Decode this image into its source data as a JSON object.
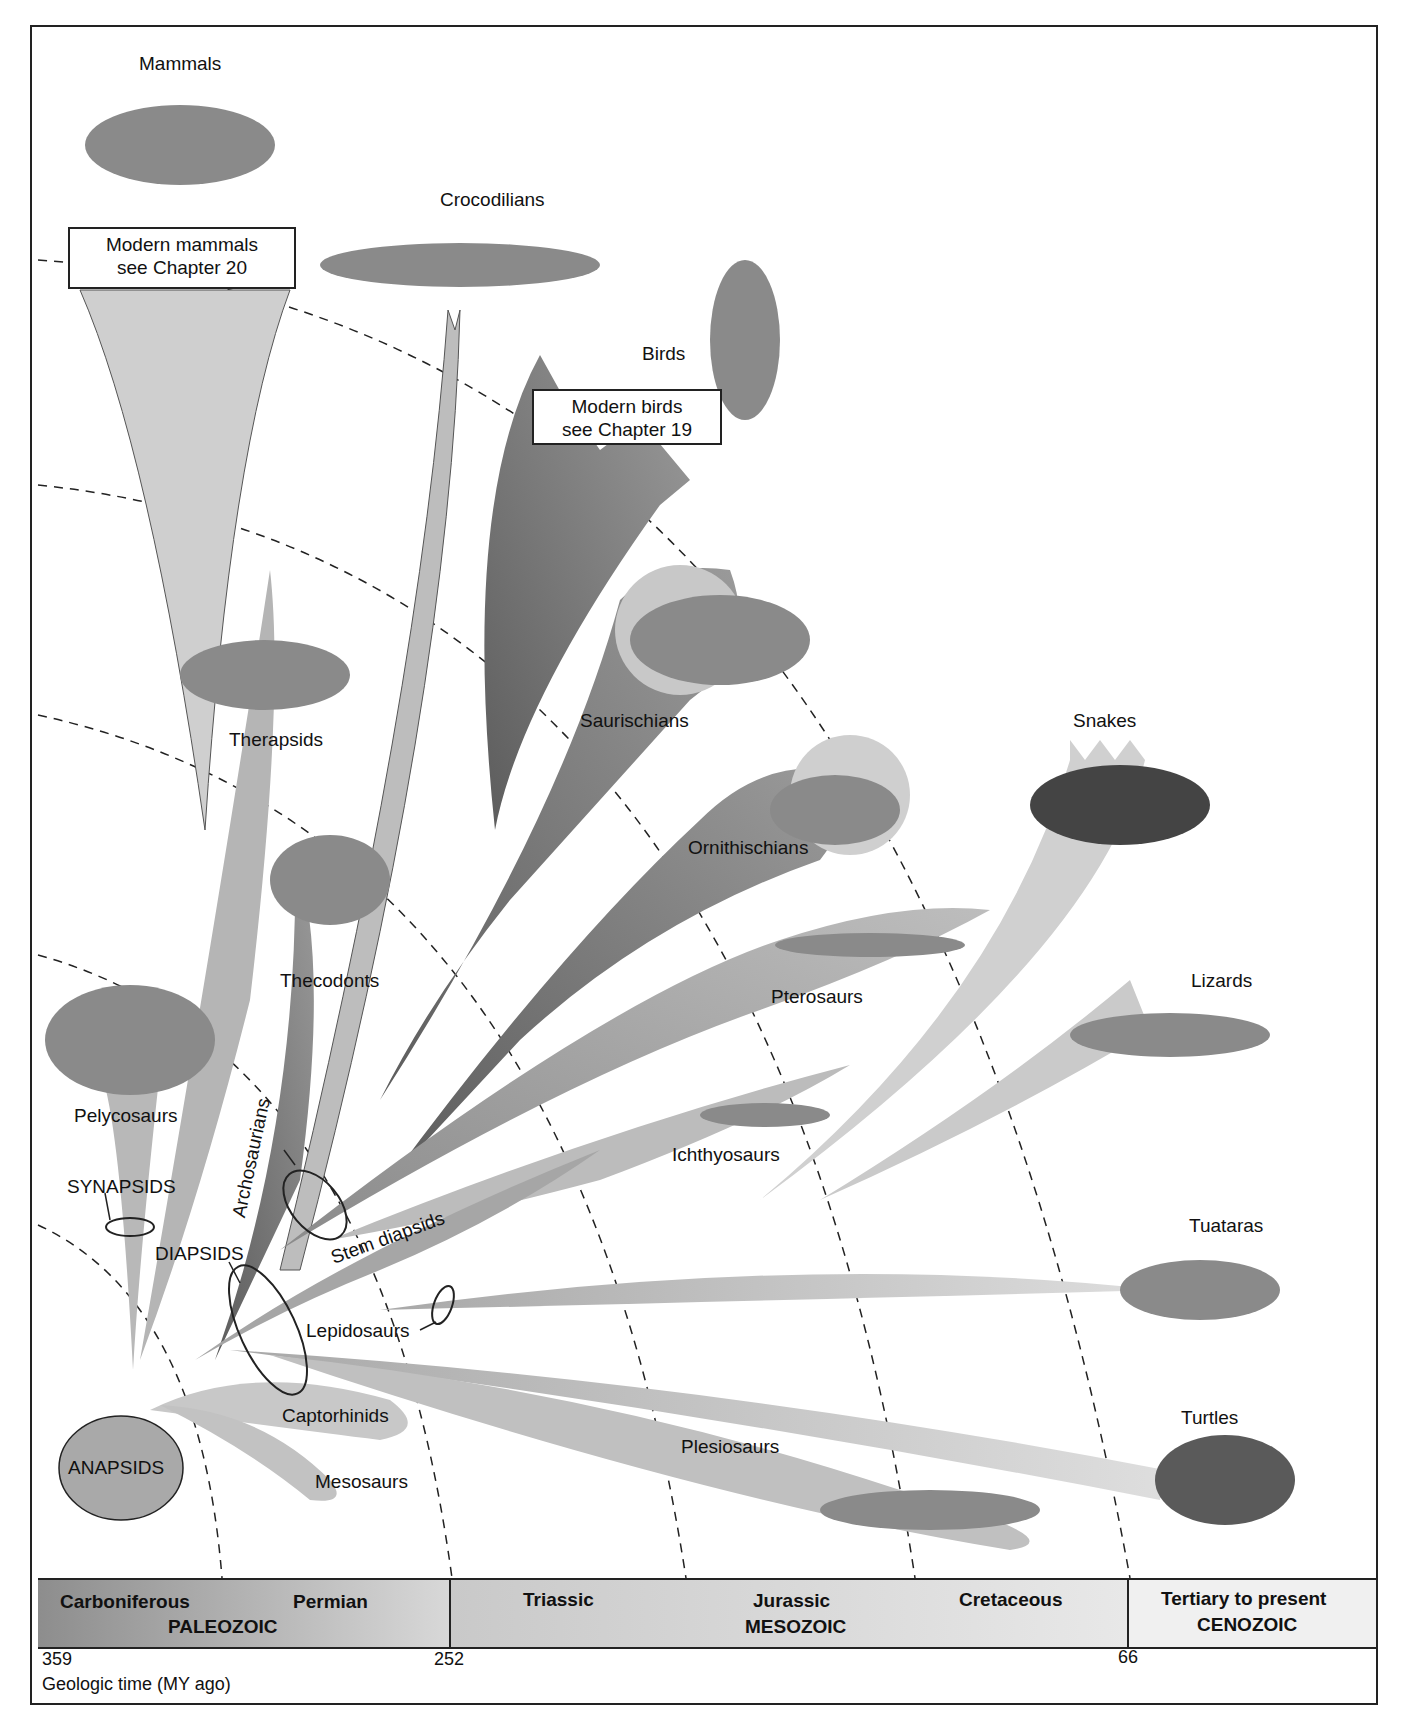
{
  "figure": {
    "taxa_labels": {
      "mammals": "Mammals",
      "crocodilians": "Crocodilians",
      "birds": "Birds",
      "therapsids": "Therapsids",
      "thecodonts": "Thecodonts",
      "saurischians": "Saurischians",
      "ornithischians": "Ornithischians",
      "pterosaurs": "Pterosaurs",
      "ichthyosaurs": "Ichthyosaurs",
      "snakes": "Snakes",
      "lizards": "Lizards",
      "tuataras": "Tuataras",
      "turtles": "Turtles",
      "pelycosaurs": "Pelycosaurs",
      "stem_diapsids": "Stem diapsids",
      "lepidosaurs": "Lepidosaurs",
      "captorhinids": "Captorhinids",
      "mesosaurs": "Mesosaurs",
      "plesiosaurs": "Plesiosaurs",
      "archosaurians": "Archosaurians"
    },
    "group_labels": {
      "synapsids": "SYNAPSIDS",
      "diapsids": "DIAPSIDS",
      "anapsids": "ANAPSIDS"
    },
    "callouts": {
      "modern_mammals_line1": "Modern mammals",
      "modern_mammals_line2": "see Chapter 20",
      "modern_birds_line1": "Modern birds",
      "modern_birds_line2": "see Chapter 19"
    }
  },
  "timeline": {
    "periods": {
      "carboniferous": "Carboniferous",
      "permian": "Permian",
      "triassic": "Triassic",
      "jurassic": "Jurassic",
      "cretaceous": "Cretaceous",
      "tertiary": "Tertiary to present"
    },
    "eras": {
      "paleozoic": "PALEOZOIC",
      "mesozoic": "MESOZOIC",
      "cenozoic": "CENOZOIC"
    },
    "ticks": {
      "t359": "359",
      "t252": "252",
      "t66": "66"
    },
    "axis_label": "Geologic time (MY ago)"
  },
  "colors": {
    "dark_branch": "#6e6e6e",
    "mid_branch": "#9a9a9a",
    "light_branch": "#c4c4c4",
    "pale_branch": "#d8d8d8",
    "outline": "#222222"
  }
}
